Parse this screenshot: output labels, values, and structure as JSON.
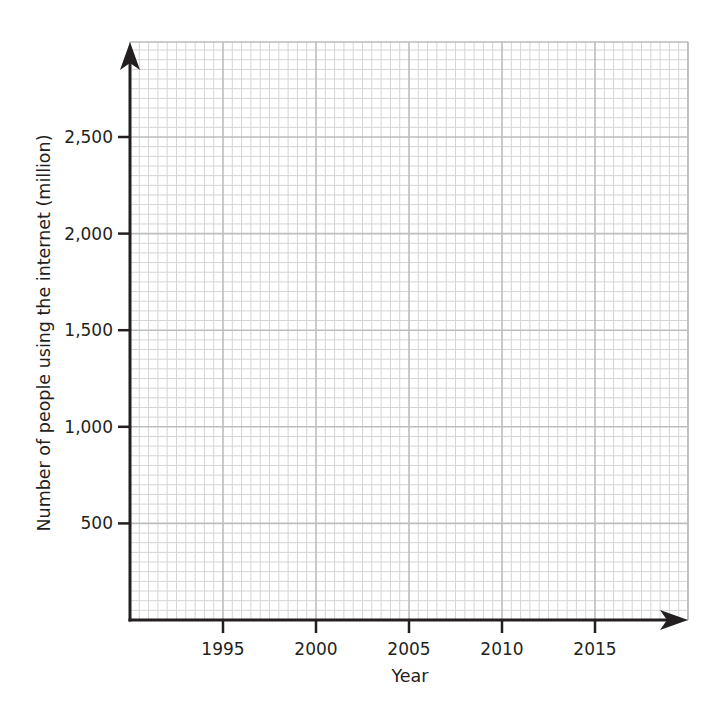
{
  "chart_data": {
    "type": "line",
    "title": "",
    "xlabel": "Year",
    "ylabel": "Number of people using the internet (million)",
    "x_ticks": [
      1995,
      2000,
      2005,
      2010,
      2015
    ],
    "x_tick_labels": [
      "1995",
      "2000",
      "2005",
      "2010",
      "2015"
    ],
    "y_ticks": [
      500,
      1000,
      1500,
      2000,
      2500
    ],
    "y_tick_labels": [
      "500",
      "1,000",
      "1,500",
      "2,000",
      "2,500"
    ],
    "xlim": [
      1990,
      2020
    ],
    "ylim": [
      0,
      3000
    ],
    "grid": true,
    "grid_style": "graph paper: minor lines every 0.5 year and 50 million; major lines at each labeled tick",
    "series": [],
    "legend": null,
    "colors": {
      "axis": "#231f20",
      "minor_grid": "#d4d4d4",
      "major_grid": "#bdbdbd",
      "background": "#ffffff"
    }
  }
}
